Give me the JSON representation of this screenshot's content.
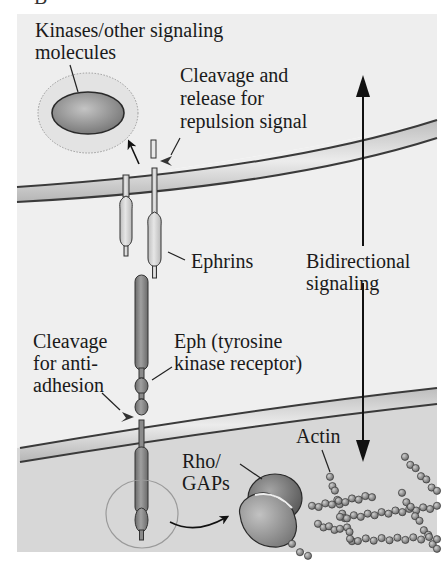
{
  "figure": {
    "type": "diagram",
    "colors": {
      "page_background": "#ffffff",
      "upper_cell": "#eeeeee",
      "lower_cell": "#d6d6d6",
      "membrane_fill": "#dcdcdc",
      "membrane_edge": "#3a3a3a",
      "ephrin_fill": "#d3d3d3",
      "eph_fill": "#7d7d7d",
      "kinase_fill": "#8c8c8c",
      "rho_top": "#6e6e6e",
      "rho_bottom": "#9a9a9a",
      "actin_bead": "#8f8f8f",
      "arrow": "#111111"
    }
  },
  "labels": {
    "kinases_line1": "Kinases/other signaling",
    "kinases_line2": "molecules",
    "cleavage_release_line1": "Cleavage and",
    "cleavage_release_line2": "release for",
    "cleavage_release_line3": "repulsion signal",
    "ephrins": "Ephrins",
    "bidirectional_line1": "Bidirectional",
    "bidirectional_line2": "signaling",
    "cleavage_anti_line1": "Cleavage",
    "cleavage_anti_line2": "for anti-",
    "cleavage_anti_line3": "adhesion",
    "eph_line1": "Eph (tyrosine",
    "eph_line2": "kinase receptor)",
    "rho_line1": "Rho/",
    "rho_line2": "GAPs",
    "actin": "Actin"
  }
}
